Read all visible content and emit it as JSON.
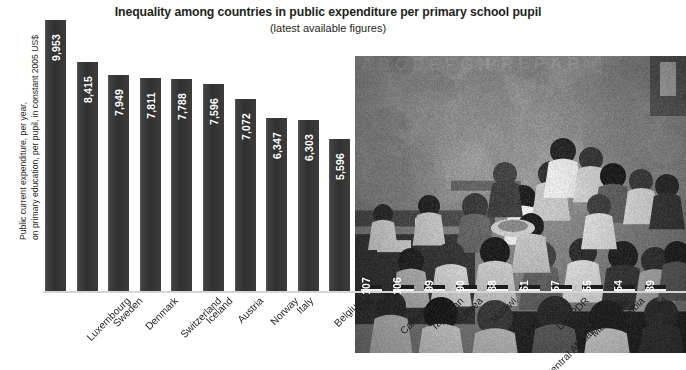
{
  "header": {
    "title": "Inequality among countries in public expenditure per primary school pupil",
    "subtitle": "(latest available figures)"
  },
  "axis": {
    "y_label_line1": "Public current expenditure, per year,",
    "y_label_line2": "on primary education, per pupil, in constant 2005 US$"
  },
  "photo": {
    "alt": "classroom-photograph",
    "wall_text": "A B C D E F G H   P R E P A R"
  },
  "chart_data": {
    "type": "bar",
    "title": "Inequality among countries in public expenditure per primary school pupil",
    "subtitle": "(latest available figures)",
    "xlabel": "",
    "ylabel": "Public current expenditure, per year, on primary education, per pupil, in constant 2005 US$",
    "ylim": [
      0,
      10400
    ],
    "grid": false,
    "legend": "none",
    "value_labels": true,
    "categories": [
      "Luxembourg",
      "Sweden",
      "Denmark",
      "Switzerland",
      "Iceland",
      "Austria",
      "Norway",
      "Italy",
      "Belgium",
      "UK",
      "Cameroon",
      "Tajikistan",
      "Eritrea",
      "Malawi",
      "Central African Republic",
      "Lao PDR",
      "Madagasar",
      "Zambia",
      "Chad",
      "Congo"
    ],
    "values": [
      9953,
      8415,
      7949,
      7811,
      7788,
      7596,
      7072,
      6347,
      6303,
      5596,
      107,
      106,
      99,
      90,
      88,
      61,
      57,
      55,
      54,
      39
    ],
    "value_text": [
      "9,953",
      "8,415",
      "7,949",
      "7,811",
      "7,788",
      "7,596",
      "7,072",
      "6,347",
      "6,303",
      "5,596",
      "107",
      "106",
      "99",
      "90",
      "88",
      "61",
      "57",
      "55",
      "54",
      "39"
    ],
    "highlight_category": "UK"
  }
}
